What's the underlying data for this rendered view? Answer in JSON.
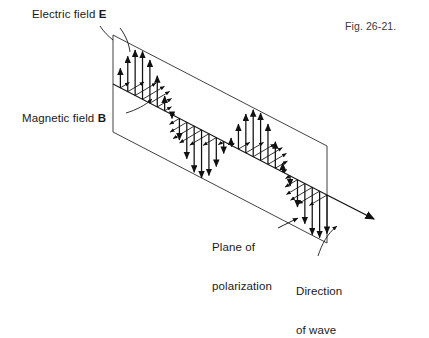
{
  "figure": {
    "caption": "Fig. 26-21.",
    "type": "physics-diagram"
  },
  "labels": {
    "electric_field": {
      "text": "Electric field ",
      "symbol": "E"
    },
    "magnetic_field": {
      "text": "Magnetic field ",
      "symbol": "B"
    },
    "plane_of_polarization_line1": "Plane of",
    "plane_of_polarization_line2": "polarization",
    "direction_of_wave_line1": "Direction",
    "direction_of_wave_line2": "of wave"
  },
  "colors": {
    "ink": "#111111",
    "line": "#1a1a1a",
    "plane_stroke": "#2b2b2b",
    "background": "#ffffff"
  },
  "geometry": {
    "plane_corners": [
      [
        113,
        35
      ],
      [
        327,
        146
      ],
      [
        327,
        243
      ],
      [
        113,
        132
      ]
    ],
    "axis_start": [
      113,
      84
    ],
    "axis_end": [
      327,
      195
    ],
    "axis_arrow_tip": [
      379,
      222
    ],
    "wave": {
      "cycles": 2,
      "samples": 30,
      "amplitude_px": 48,
      "b_field_amplitude_px": 26,
      "b_field_dx": 22,
      "b_field_dy": -13
    }
  },
  "chart_data": {
    "type": "line",
    "xlabel": "Direction of wave",
    "ylabel": "Field amplitude",
    "series": [
      {
        "name": "Electric field E",
        "orientation": "vertical (in plane of polarization)",
        "values": [
          0.0,
          0.41,
          0.74,
          0.95,
          1.0,
          0.9,
          0.65,
          0.31,
          -0.08,
          -0.45,
          -0.76,
          -0.96,
          -1.0,
          -0.87,
          -0.6,
          -0.25,
          0.15,
          0.52,
          0.81,
          0.98,
          0.99,
          0.84,
          0.55,
          0.19,
          -0.21,
          -0.57,
          -0.84,
          -0.99,
          -0.97,
          -0.8
        ]
      },
      {
        "name": "Magnetic field B",
        "orientation": "perpendicular to E (into page)",
        "values": [
          0.0,
          0.41,
          0.74,
          0.95,
          1.0,
          0.9,
          0.65,
          0.31,
          -0.08,
          -0.45,
          -0.76,
          -0.96,
          -1.0,
          -0.87,
          -0.6,
          -0.25,
          0.15,
          0.52,
          0.81,
          0.98,
          0.99,
          0.84,
          0.55,
          0.19,
          -0.21,
          -0.57,
          -0.84,
          -0.99,
          -0.97,
          -0.8
        ]
      }
    ],
    "x": [
      0,
      1,
      2,
      3,
      4,
      5,
      6,
      7,
      8,
      9,
      10,
      11,
      12,
      13,
      14,
      15,
      16,
      17,
      18,
      19,
      20,
      21,
      22,
      23,
      24,
      25,
      26,
      27,
      28,
      29
    ],
    "ylim": [
      -1,
      1
    ],
    "grid": false,
    "legend": "none"
  }
}
